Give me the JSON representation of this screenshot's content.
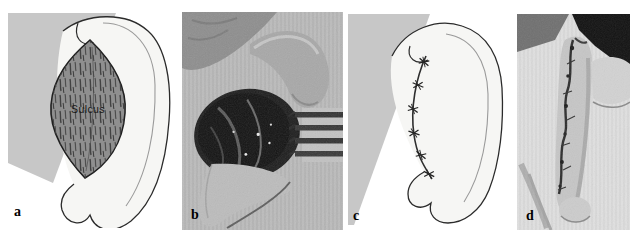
{
  "figure": {
    "kind": "four-panel-medical-figure",
    "background_color": "#ffffff",
    "panels": [
      {
        "id": "a",
        "label": "a",
        "type": "illustration",
        "annotation": "Sulcus"
      },
      {
        "id": "b",
        "label": "b",
        "type": "photograph"
      },
      {
        "id": "c",
        "label": "c",
        "type": "illustration",
        "suture_count": 6
      },
      {
        "id": "d",
        "label": "d",
        "type": "photograph"
      }
    ],
    "colors": {
      "panel_background_gray": "#c7c7c7",
      "ear_fill": "#f6f6f4",
      "outline": "#2b2b2b",
      "sulcus_fill": "#8f8f8f",
      "photo_dark_wound": "#1e1e1e",
      "label_color": "#000000"
    }
  }
}
